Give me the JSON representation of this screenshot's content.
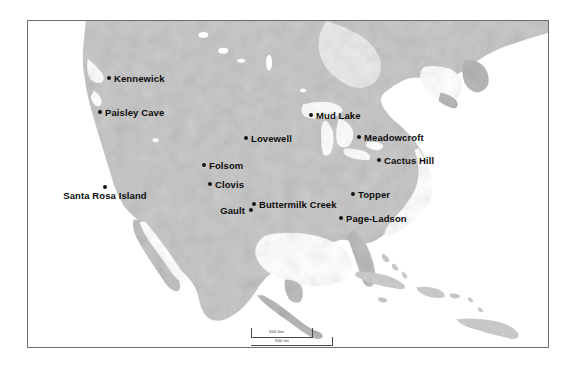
{
  "map": {
    "title": "North America archaeological sites map",
    "projection_note": "shaded relief, grayscale",
    "frame": {
      "x": 27,
      "y": 20,
      "width": 522,
      "height": 328,
      "border_color": "#6e6e6e"
    },
    "colors": {
      "ocean": "#ffffff",
      "land_light": "#d2d2d2",
      "land_mid": "#b8b8b8",
      "land_dark": "#9a9a9a",
      "lake": "#ffffff",
      "marker": "#141414",
      "label": "#0d0d0d"
    }
  },
  "sites": [
    {
      "name": "Kennewick",
      "label": "Kennewick",
      "x": 108,
      "y": 77,
      "label_pos": "right"
    },
    {
      "name": "Paisley Cave",
      "label": "Paisley Cave",
      "x": 99,
      "y": 111,
      "label_pos": "right"
    },
    {
      "name": "Santa Rosa Island",
      "label": "Santa Rosa Island",
      "x": 104,
      "y": 186,
      "label_pos": "below"
    },
    {
      "name": "Folsom",
      "label": "Folsom",
      "x": 203,
      "y": 164,
      "label_pos": "right"
    },
    {
      "name": "Clovis",
      "label": "Clovis",
      "x": 209,
      "y": 183,
      "label_pos": "right"
    },
    {
      "name": "Gault",
      "label": "Gault",
      "x": 250,
      "y": 209,
      "label_pos": "left"
    },
    {
      "name": "Buttermilk Creek",
      "label": "Buttermilk Creek",
      "x": 253,
      "y": 203,
      "label_pos": "right"
    },
    {
      "name": "Lovewell",
      "label": "Lovewell",
      "x": 245,
      "y": 137,
      "label_pos": "right"
    },
    {
      "name": "Mud Lake",
      "label": "Mud Lake",
      "x": 310,
      "y": 114,
      "label_pos": "right"
    },
    {
      "name": "Meadowcroft",
      "label": "Meadowcroft",
      "x": 358,
      "y": 136,
      "label_pos": "right"
    },
    {
      "name": "Cactus Hill",
      "label": "Cactus Hill",
      "x": 378,
      "y": 159,
      "label_pos": "right"
    },
    {
      "name": "Topper",
      "label": "Topper",
      "x": 352,
      "y": 193,
      "label_pos": "right"
    },
    {
      "name": "Page-Ladson",
      "label": "Page-Ladson",
      "x": 340,
      "y": 217,
      "label_pos": "right"
    }
  ],
  "scale_bar": {
    "km_label": "500 km",
    "mi_label": "500 mi"
  }
}
